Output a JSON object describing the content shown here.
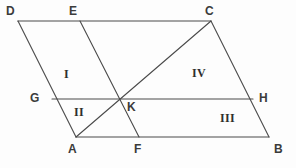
{
  "figure": {
    "type": "geometry-diagram",
    "shape": "parallelogram",
    "background_color": "#fdfdfd",
    "stroke_color": "#4a4a4a",
    "label_color": "#3b3b3b",
    "width": 296,
    "height": 168
  },
  "points": [
    {
      "id": "D",
      "label": "D",
      "x": 18,
      "y": 21,
      "label_x": 6,
      "label_y": 5
    },
    {
      "id": "E",
      "label": "E",
      "x": 80,
      "y": 21,
      "label_x": 69,
      "label_y": 5
    },
    {
      "id": "C",
      "label": "C",
      "x": 211,
      "y": 21,
      "label_x": 205,
      "label_y": 5
    },
    {
      "id": "G",
      "label": "G",
      "x": 52,
      "y": 99,
      "label_x": 30,
      "label_y": 92
    },
    {
      "id": "K",
      "label": "K",
      "x": 119,
      "y": 99,
      "label_x": 127,
      "label_y": 101
    },
    {
      "id": "H",
      "label": "H",
      "x": 253,
      "y": 99,
      "label_x": 259,
      "label_y": 92
    },
    {
      "id": "A",
      "label": "A",
      "x": 76,
      "y": 137,
      "label_x": 68,
      "label_y": 143
    },
    {
      "id": "F",
      "label": "F",
      "x": 139,
      "y": 137,
      "label_x": 134,
      "label_y": 143
    },
    {
      "id": "B",
      "label": "B",
      "x": 269,
      "y": 137,
      "label_x": 274,
      "label_y": 143
    }
  ],
  "segments": [
    {
      "id": "DC",
      "from": "D",
      "to": "C",
      "name": "segment-dc",
      "x1": 18,
      "y1": 21,
      "x2": 211,
      "y2": 21
    },
    {
      "id": "AB",
      "from": "A",
      "to": "B",
      "name": "segment-ab",
      "x1": 76,
      "y1": 137,
      "x2": 269,
      "y2": 137
    },
    {
      "id": "DA",
      "from": "D",
      "to": "A",
      "name": "segment-da",
      "x1": 18,
      "y1": 21,
      "x2": 76,
      "y2": 137
    },
    {
      "id": "CB",
      "from": "C",
      "to": "B",
      "name": "segment-cb",
      "x1": 211,
      "y1": 21,
      "x2": 269,
      "y2": 137
    },
    {
      "id": "GH",
      "from": "G",
      "to": "H",
      "name": "segment-gh",
      "x1": 52,
      "y1": 99,
      "x2": 253,
      "y2": 99
    },
    {
      "id": "EF",
      "from": "E",
      "to": "F",
      "name": "segment-ef",
      "x1": 80,
      "y1": 21,
      "x2": 139,
      "y2": 137
    },
    {
      "id": "AC",
      "from": "A",
      "to": "C",
      "name": "segment-ac",
      "x1": 76,
      "y1": 137,
      "x2": 211,
      "y2": 21
    }
  ],
  "regions": [
    {
      "id": "I",
      "label": "I",
      "x": 64,
      "y": 68
    },
    {
      "id": "II",
      "label": "II",
      "x": 74,
      "y": 106
    },
    {
      "id": "III",
      "label": "III",
      "x": 220,
      "y": 112
    },
    {
      "id": "IV",
      "label": "IV",
      "x": 192,
      "y": 67
    }
  ]
}
